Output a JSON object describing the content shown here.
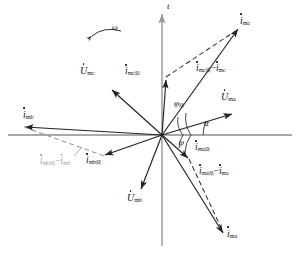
{
  "figure": {
    "type": "phasor-diagram",
    "origin": {
      "x": 162,
      "y": 135
    },
    "axes": {
      "vertical_label": "t",
      "horizontal_label": "",
      "x_axis": {
        "x1": 8,
        "y1": 135,
        "x2": 292,
        "y2": 135
      },
      "y_axis": {
        "x1": 162,
        "y1": 246,
        "x2": 162,
        "y2": 10
      }
    },
    "rotation": {
      "label": "ω",
      "label_x": 113,
      "label_y": 28,
      "arc": "M 92,36 Q 104,26 120,31"
    },
    "angles": [
      {
        "name": "alpha",
        "label": "α",
        "x": 205,
        "y": 123
      },
      {
        "name": "phi-zero",
        "label": "φ",
        "sub": "|0|",
        "x": 176,
        "y": 104
      },
      {
        "name": "phi",
        "label": "φ",
        "sub": "",
        "x": 180,
        "y": 140
      }
    ],
    "vectors": [
      {
        "name": "i-mc",
        "symbol": "i",
        "sub": "mc",
        "dotted_symbol": true,
        "style": "solid",
        "color": "#222",
        "x1": 162,
        "y1": 135,
        "x2": 240,
        "y2": 27,
        "label_x": 243,
        "label_y": 18
      },
      {
        "name": "i-mc-zero",
        "symbol": "i",
        "sub": "mc|0|",
        "dotted_symbol": true,
        "style": "solid",
        "color": "#222",
        "x1": 162,
        "y1": 135,
        "x2": 166,
        "y2": 77,
        "label_x": 128,
        "label_y": 68
      },
      {
        "name": "u-mc",
        "symbol": "U",
        "sub": "mc",
        "dotted_symbol": true,
        "style": "solid",
        "color": "#222",
        "x1": 162,
        "y1": 135,
        "x2": 110,
        "y2": 88,
        "label_x": 83,
        "label_y": 72
      },
      {
        "name": "u-ma",
        "symbol": "U",
        "sub": "ma",
        "dotted_symbol": true,
        "style": "solid",
        "color": "#222",
        "x1": 162,
        "y1": 135,
        "x2": 234,
        "y2": 113,
        "label_x": 222,
        "label_y": 96
      },
      {
        "name": "i-ma-zero",
        "symbol": "i",
        "sub": "ma|0|",
        "dotted_symbol": true,
        "style": "solid",
        "color": "#222",
        "x1": 162,
        "y1": 135,
        "x2": 190,
        "y2": 160,
        "label_x": 198,
        "label_y": 146
      },
      {
        "name": "i-ma",
        "symbol": "i",
        "sub": "ma",
        "dotted_symbol": true,
        "style": "solid",
        "color": "#222",
        "x1": 162,
        "y1": 135,
        "x2": 225,
        "y2": 236,
        "label_x": 228,
        "label_y": 231
      },
      {
        "name": "i-mb",
        "symbol": "i",
        "sub": "mb",
        "dotted_symbol": true,
        "style": "solid",
        "color": "#222",
        "x1": 162,
        "y1": 135,
        "x2": 22,
        "y2": 127,
        "label_x": 23,
        "label_y": 113
      },
      {
        "name": "i-mb-zero",
        "symbol": "i",
        "sub": "mb|0|",
        "dotted_symbol": true,
        "style": "solid",
        "color": "#222",
        "x1": 162,
        "y1": 135,
        "x2": 103,
        "y2": 156,
        "label_x": 88,
        "label_y": 159
      },
      {
        "name": "u-mb",
        "symbol": "U",
        "sub": "mb",
        "dotted_symbol": true,
        "style": "solid",
        "color": "#222",
        "x1": 162,
        "y1": 135,
        "x2": 140,
        "y2": 192,
        "label_x": 128,
        "label_y": 196
      }
    ],
    "difference_vectors": [
      {
        "name": "i-mc-diff",
        "symbol": "i",
        "sub": "mc|0|",
        "op": "−",
        "symbol2": "i",
        "sub2": "mc",
        "style": "dashed",
        "color": "#333",
        "x1": 166,
        "y1": 77,
        "x2": 240,
        "y2": 27,
        "label_x": 197,
        "label_y": 68
      },
      {
        "name": "i-ma-diff",
        "symbol": "i",
        "sub": "ma|0|",
        "op": "−",
        "symbol2": "i",
        "sub2": "ma",
        "style": "dashed",
        "color": "#333",
        "x1": 190,
        "y1": 160,
        "x2": 225,
        "y2": 236,
        "label_x": 200,
        "label_y": 170
      },
      {
        "name": "i-mb-diff",
        "symbol": "i",
        "sub": "mb|0|",
        "op": "−",
        "symbol2": "i",
        "sub2": "mb",
        "style": "dashed",
        "color": "#9a9a9a",
        "x1": 103,
        "y1": 156,
        "x2": 22,
        "y2": 127,
        "label_x": 42,
        "label_y": 160,
        "leader": "M 72,157 L 80,147"
      }
    ],
    "colors": {
      "axis": "#8d8d8d",
      "vector": "#222222",
      "dashed": "#333333",
      "faint": "#9a9a9a",
      "background": "#ffffff"
    }
  }
}
